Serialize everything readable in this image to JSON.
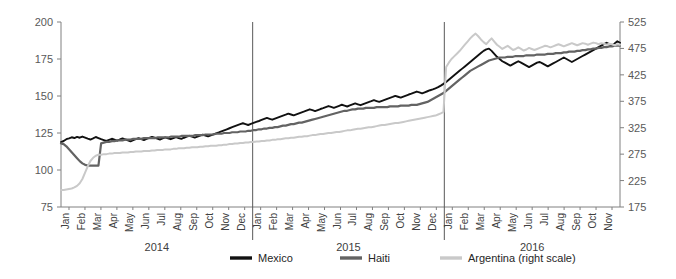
{
  "chart_data": {
    "type": "line",
    "title": "",
    "subtitle": "",
    "xlabel": "",
    "ylabel": "",
    "y2label": "",
    "grid": false,
    "legend_position": "bottom",
    "axes": {
      "left": {
        "min": 75,
        "max": 200,
        "ticks": [
          75,
          100,
          125,
          150,
          175,
          200
        ],
        "tick_labels": [
          "75",
          "100",
          "125",
          "150",
          "175",
          "200"
        ]
      },
      "right": {
        "label": "right scale",
        "min": 175,
        "max": 525,
        "ticks": [
          175,
          225,
          275,
          325,
          375,
          425,
          475,
          525
        ],
        "tick_labels": [
          "175",
          "225",
          "275",
          "325",
          "375",
          "425",
          "475",
          "525"
        ]
      },
      "x": {
        "months": [
          "Jan",
          "Feb",
          "Mar",
          "Apr",
          "May",
          "Jun",
          "Jul",
          "Aug",
          "Sep",
          "Oct",
          "Nov",
          "Dec"
        ],
        "years": [
          "2014",
          "2015",
          "2016"
        ],
        "last_year_months": [
          "Jan",
          "Feb",
          "Mar",
          "Apr",
          "May",
          "Jun",
          "Jul",
          "Aug",
          "Sep",
          "Oct",
          "Nov"
        ]
      }
    },
    "colors": {
      "mexico": "#111111",
      "haiti": "#636363",
      "argentina": "#c9c9c9",
      "axis": "#808080",
      "text": "#404040"
    },
    "series": [
      {
        "name": "Mexico",
        "color": "#111111",
        "axis": "left",
        "values": [
          118.9,
          119.6,
          120.8,
          121.4,
          122.1,
          121.6,
          122.4,
          121.8,
          122.6,
          121.9,
          121.2,
          120.6,
          121.4,
          122.3,
          121.6,
          120.8,
          120.2,
          119.6,
          120.4,
          121.1,
          120.5,
          119.8,
          120.6,
          121.3,
          120.7,
          120.1,
          119.4,
          120.2,
          120.9,
          121.5,
          120.8,
          120.2,
          121.0,
          121.7,
          122.4,
          121.8,
          121.2,
          120.6,
          121.3,
          122.0,
          121.4,
          120.8,
          121.5,
          122.2,
          121.6,
          121.0,
          121.8,
          122.5,
          123.1,
          122.5,
          121.9,
          122.6,
          123.3,
          123.9,
          123.3,
          122.7,
          123.4,
          124.1,
          124.8,
          125.4,
          126.1,
          126.8,
          127.5,
          128.2,
          128.9,
          129.6,
          130.3,
          131.0,
          131.6,
          131.0,
          130.4,
          131.1,
          131.8,
          132.5,
          133.1,
          133.8,
          134.5,
          135.2,
          134.6,
          134.0,
          134.7,
          135.4,
          136.1,
          136.8,
          137.4,
          138.1,
          137.5,
          136.9,
          137.6,
          138.3,
          139.0,
          139.6,
          140.3,
          141.0,
          140.4,
          139.8,
          140.5,
          141.2,
          141.8,
          142.5,
          143.2,
          142.6,
          142.0,
          142.7,
          143.4,
          144.1,
          143.5,
          142.9,
          143.6,
          144.3,
          145.0,
          144.4,
          143.8,
          144.5,
          145.2,
          145.9,
          146.5,
          147.2,
          146.6,
          146.0,
          146.7,
          147.4,
          148.1,
          148.8,
          149.4,
          150.1,
          149.5,
          148.9,
          149.6,
          150.3,
          151.0,
          151.6,
          152.3,
          153.0,
          152.4,
          151.8,
          152.5,
          153.2,
          153.9,
          154.5,
          155.2,
          156.0,
          157.0,
          158.2,
          159.5,
          161.0,
          162.5,
          164.0,
          165.5,
          167.0,
          168.5,
          170.0,
          171.5,
          173.0,
          174.5,
          176.0,
          177.5,
          179.0,
          180.5,
          181.5,
          182.0,
          180.5,
          178.5,
          176.5,
          175.0,
          173.5,
          172.5,
          171.5,
          170.5,
          171.5,
          172.5,
          173.5,
          172.5,
          171.5,
          170.5,
          169.5,
          170.5,
          171.5,
          172.5,
          173.0,
          172.0,
          171.0,
          170.0,
          171.0,
          172.0,
          173.0,
          174.0,
          175.0,
          176.0,
          175.0,
          174.0,
          173.0,
          174.0,
          175.0,
          176.0,
          177.0,
          178.0,
          179.0,
          180.0,
          181.0,
          182.0,
          183.0,
          184.0,
          185.0,
          186.0,
          185.0,
          184.0,
          185.5,
          187.0,
          186.0
        ]
      },
      {
        "name": "Haiti",
        "color": "#636363",
        "axis": "left",
        "values": [
          118.0,
          117.5,
          116.0,
          114.0,
          112.0,
          110.0,
          108.0,
          106.0,
          104.5,
          103.5,
          103.0,
          103.0,
          103.0,
          103.0,
          103.0,
          118.0,
          118.5,
          119.0,
          119.0,
          119.5,
          119.5,
          120.0,
          120.0,
          120.0,
          120.5,
          120.5,
          120.5,
          121.0,
          121.0,
          121.0,
          121.0,
          121.5,
          121.5,
          121.5,
          121.5,
          121.5,
          122.0,
          122.0,
          122.0,
          122.0,
          122.0,
          122.5,
          122.5,
          122.5,
          122.5,
          123.0,
          123.0,
          123.0,
          123.0,
          123.0,
          123.5,
          123.5,
          123.5,
          123.5,
          124.0,
          124.0,
          124.0,
          124.0,
          124.5,
          124.5,
          124.5,
          125.0,
          125.0,
          125.0,
          125.5,
          125.5,
          125.5,
          126.0,
          126.0,
          126.0,
          126.5,
          126.5,
          127.0,
          127.0,
          127.5,
          127.5,
          128.0,
          128.0,
          128.5,
          128.5,
          129.0,
          129.0,
          129.5,
          130.0,
          130.0,
          130.5,
          131.0,
          131.0,
          131.5,
          132.0,
          132.0,
          132.5,
          133.0,
          133.5,
          134.0,
          134.5,
          135.0,
          135.5,
          136.0,
          136.5,
          137.0,
          137.5,
          138.0,
          138.5,
          139.0,
          139.5,
          140.0,
          140.0,
          140.5,
          141.0,
          141.0,
          141.5,
          141.5,
          141.5,
          142.0,
          142.0,
          142.0,
          142.0,
          142.5,
          142.5,
          142.5,
          142.5,
          142.5,
          143.0,
          143.0,
          143.0,
          143.0,
          143.5,
          143.5,
          143.5,
          143.5,
          144.0,
          144.0,
          144.0,
          144.5,
          145.0,
          145.5,
          146.0,
          147.0,
          148.0,
          149.0,
          150.0,
          151.0,
          152.0,
          153.5,
          155.0,
          156.5,
          158.0,
          159.5,
          161.0,
          162.5,
          164.0,
          165.5,
          167.0,
          168.0,
          169.0,
          170.0,
          171.0,
          172.0,
          173.0,
          174.0,
          174.5,
          175.0,
          175.5,
          176.0,
          176.0,
          176.0,
          176.5,
          176.5,
          176.5,
          177.0,
          177.0,
          177.0,
          177.0,
          177.5,
          177.5,
          177.5,
          177.5,
          178.0,
          178.0,
          178.0,
          178.0,
          178.5,
          178.5,
          178.5,
          179.0,
          179.0,
          179.0,
          179.5,
          179.5,
          180.0,
          180.0,
          180.0,
          180.5,
          180.5,
          181.0,
          181.0,
          181.5,
          181.5,
          182.0,
          182.0,
          182.5,
          182.5,
          183.0,
          183.0,
          183.5,
          183.5,
          184.0,
          184.0,
          184.0
        ]
      },
      {
        "name": "Argentina (right scale)",
        "color": "#c9c9c9",
        "axis": "right",
        "values": [
          207,
          207,
          208,
          209,
          210,
          212,
          215,
          220,
          228,
          240,
          252,
          262,
          268,
          272,
          274,
          274,
          275,
          275,
          276,
          276,
          277,
          277,
          277,
          278,
          278,
          278,
          279,
          279,
          280,
          280,
          280,
          281,
          281,
          281,
          282,
          282,
          283,
          283,
          283,
          284,
          284,
          284,
          285,
          285,
          286,
          286,
          286,
          287,
          287,
          288,
          288,
          288,
          289,
          289,
          290,
          290,
          291,
          291,
          291,
          292,
          292,
          293,
          293,
          294,
          294,
          295,
          295,
          296,
          296,
          297,
          297,
          298,
          298,
          299,
          299,
          300,
          300,
          301,
          301,
          302,
          302,
          303,
          303,
          304,
          305,
          305,
          306,
          306,
          307,
          308,
          308,
          309,
          309,
          310,
          311,
          311,
          312,
          313,
          313,
          314,
          315,
          315,
          316,
          317,
          317,
          318,
          319,
          320,
          320,
          321,
          322,
          323,
          323,
          324,
          325,
          326,
          326,
          327,
          328,
          329,
          330,
          330,
          331,
          332,
          333,
          334,
          334,
          335,
          336,
          337,
          338,
          339,
          340,
          341,
          342,
          343,
          344,
          345,
          346,
          347,
          348,
          350,
          352,
          355,
          440,
          448,
          455,
          460,
          465,
          470,
          476,
          482,
          488,
          494,
          499,
          503,
          498,
          492,
          487,
          483,
          489,
          494,
          488,
          482,
          478,
          474,
          477,
          480,
          476,
          472,
          474,
          477,
          474,
          471,
          473,
          476,
          474,
          472,
          474,
          476,
          478,
          480,
          479,
          477,
          479,
          481,
          483,
          481,
          479,
          481,
          483,
          485,
          483,
          481,
          483,
          485,
          484,
          482,
          484,
          486,
          485,
          483,
          485,
          484,
          482,
          484,
          483,
          481,
          483,
          482
        ]
      }
    ],
    "annotations": []
  },
  "legend": {
    "items": [
      {
        "label": "Mexico",
        "color": "#111111"
      },
      {
        "label": "Haiti",
        "color": "#636363"
      },
      {
        "label": "Argentina (right scale)",
        "color": "#c9c9c9"
      }
    ]
  }
}
